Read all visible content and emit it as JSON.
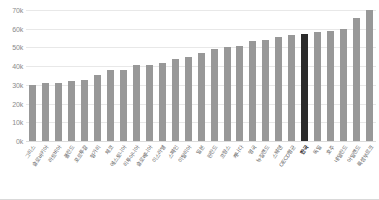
{
  "chart_data": {
    "type": "bar",
    "title": "",
    "subtitle": "",
    "xlabel": "",
    "ylabel": "",
    "ylim": [
      0,
      70000
    ],
    "ytick_labels": [
      "70k",
      "60k",
      "50k",
      "40k",
      "30k",
      "20k",
      "10k",
      "0k"
    ],
    "ytick_values": [
      70000,
      60000,
      50000,
      40000,
      30000,
      20000,
      10000,
      0
    ],
    "grid": true,
    "legend": "none",
    "highlight_category": "한국",
    "highlight_color": "#2b2b2b",
    "bar_color": "#989898",
    "categories": [
      "그리스",
      "슬로바키아",
      "라트비아",
      "폴란드",
      "포르투갈",
      "헝가리",
      "체코",
      "에스토니아",
      "리투아니아",
      "슬로베니아",
      "이스라엘",
      "스페인",
      "이탈리아",
      "일본",
      "핀란드",
      "프랑스",
      "캐나다",
      "영국",
      "뉴질랜드",
      "스웨덴",
      "OECD평균",
      "한국",
      "독일",
      "호주",
      "네덜란드",
      "아일랜드",
      "룩셈부르크"
    ],
    "values": [
      30000,
      31000,
      31000,
      32000,
      32500,
      35500,
      38000,
      38000,
      40500,
      40500,
      41500,
      44000,
      45000,
      47000,
      49000,
      50500,
      51000,
      53500,
      54000,
      55500,
      56500,
      57000,
      58500,
      59000,
      60000,
      65500,
      70000
    ]
  }
}
